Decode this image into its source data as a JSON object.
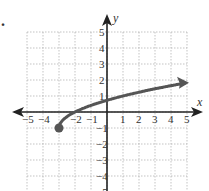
{
  "problem_marker": ".",
  "chart_data": {
    "type": "line",
    "title": "",
    "xlabel": "x",
    "ylabel": "y",
    "xlim": [
      -5,
      5
    ],
    "ylim": [
      -5,
      5
    ],
    "grid": true,
    "x_ticks": [
      -5,
      -4,
      -2,
      -1,
      1,
      2,
      3,
      4,
      5
    ],
    "x_tick_labels": [
      "−5",
      "−4",
      "−2",
      "−1",
      "1",
      "2",
      "3",
      "4",
      "5"
    ],
    "y_ticks": [
      5,
      4,
      3,
      2,
      1,
      -1,
      -2,
      -3,
      -4,
      -5
    ],
    "y_tick_labels": [
      "5",
      "4",
      "3",
      "2",
      "1",
      "−1",
      "−2",
      "−3",
      "−4",
      "−5"
    ],
    "series": [
      {
        "name": "y = √(x+3) − 1",
        "start_point": [
          -3,
          -1
        ],
        "start_marker": "closed-dot",
        "end_marker": "arrow",
        "x": [
          -3,
          -2.75,
          -2.5,
          -2,
          -1,
          0,
          1,
          2,
          3,
          4,
          5
        ],
        "y": [
          -1,
          -0.5,
          -0.29,
          0,
          0.41,
          0.73,
          1,
          1.24,
          1.45,
          1.65,
          1.83
        ]
      }
    ],
    "color": "#555555"
  }
}
